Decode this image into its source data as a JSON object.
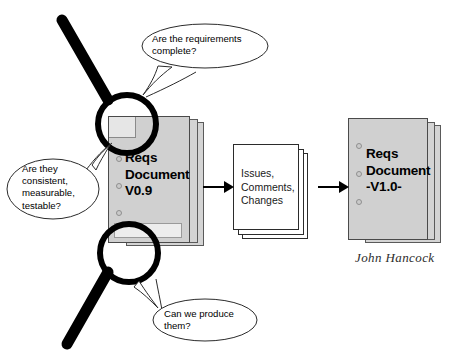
{
  "figure": {
    "background_color": "#ffffff",
    "stroke_color": "#000000"
  },
  "bubbles": [
    {
      "id": "requirements-complete",
      "text": "Are the requirements\ncomplete?"
    },
    {
      "id": "consistent-measurable-testable",
      "text": "Are they\nconsistent,\nmeasurable,\ntestable?"
    },
    {
      "id": "can-we-produce",
      "text": "Can we produce\nthem?"
    }
  ],
  "documents": [
    {
      "id": "reqs-document-v09",
      "title": "Reqs\nDocument\nV0.9",
      "fill": "#d4d4d4",
      "sheets": 3,
      "holes": 3
    },
    {
      "id": "issues-comments-changes",
      "title": "Issues,\nComments,\nChanges",
      "fill": "#ffffff",
      "sheets": 3,
      "holes": 0
    },
    {
      "id": "reqs-document-v10",
      "title": "Reqs\nDocument\n-V1.0-",
      "fill": "#d4d4d4",
      "sheets": 3,
      "holes": 3
    }
  ],
  "signature": {
    "text": "John Hancock"
  },
  "arrows": [
    {
      "id": "arrow-review-to-issues"
    },
    {
      "id": "arrow-issues-to-final"
    }
  ],
  "magnifiers": [
    {
      "id": "magnifier-top"
    },
    {
      "id": "magnifier-bottom"
    }
  ]
}
